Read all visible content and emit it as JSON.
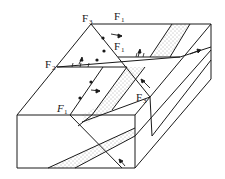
{
  "diagram": {
    "labels": [
      {
        "id": "f3-top",
        "text": "F",
        "sub": "3",
        "x": 82,
        "y": 22
      },
      {
        "id": "f1-top",
        "text": "F",
        "sub": "1",
        "x": 114,
        "y": 20
      },
      {
        "id": "f1-mid",
        "text": "F",
        "sub": "1",
        "x": 114,
        "y": 50
      },
      {
        "id": "f2-left",
        "text": "F",
        "sub": "2",
        "x": 45,
        "y": 68
      },
      {
        "id": "f1-low",
        "text": "F",
        "sub": "1",
        "x": 57,
        "y": 112
      },
      {
        "id": "f3-right",
        "text": "F",
        "sub": "3",
        "x": 136,
        "y": 101
      }
    ],
    "colors": {
      "line": "#1a1a1a",
      "background": "#ffffff",
      "stipple": "#555555"
    }
  }
}
